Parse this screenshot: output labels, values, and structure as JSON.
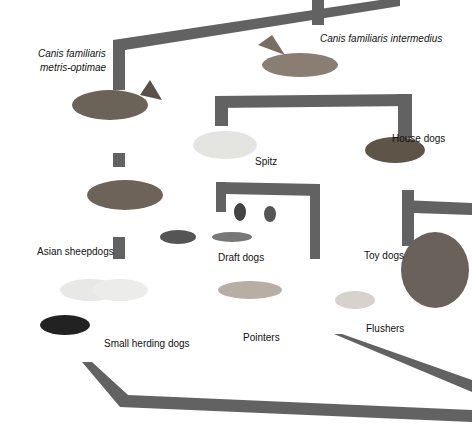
{
  "diagram": {
    "title": "",
    "branch_color": "#555555",
    "labels": {
      "root_left_line1": "Canis familiaris",
      "root_left_line2": "metris-optimae",
      "root_right": "Canis familiaris intermedius",
      "spitz": "Spitz",
      "house_dogs": "House dogs",
      "asian_sheepdogs": "Asian sheepdogs",
      "draft_dogs": "Draft dogs",
      "toy_dogs": "Toy dogs",
      "small_herding_dogs": "Small herding dogs",
      "pointers": "Pointers",
      "flushers": "Flushers"
    },
    "nodes": [
      {
        "id": "metris-optimae",
        "label": "Canis familiaris metris-optimae",
        "children": [
          "asian-sheepdogs"
        ]
      },
      {
        "id": "intermedius",
        "label": "Canis familiaris intermedius",
        "children": [
          "spitz",
          "house-dogs"
        ]
      },
      {
        "id": "spitz",
        "label": "Spitz",
        "children": [
          "draft-dogs"
        ]
      },
      {
        "id": "house-dogs",
        "label": "House dogs",
        "children": [
          "toy-dogs"
        ]
      },
      {
        "id": "asian-sheepdogs",
        "label": "Asian sheepdogs",
        "children": [
          "small-herding-dogs"
        ]
      },
      {
        "id": "draft-dogs",
        "label": "Draft dogs",
        "children": []
      },
      {
        "id": "toy-dogs",
        "label": "Toy dogs",
        "children": []
      },
      {
        "id": "small-herding-dogs",
        "label": "Small herding dogs",
        "children": []
      },
      {
        "id": "pointers",
        "label": "Pointers",
        "children": []
      },
      {
        "id": "flushers",
        "label": "Flushers",
        "children": []
      }
    ]
  }
}
